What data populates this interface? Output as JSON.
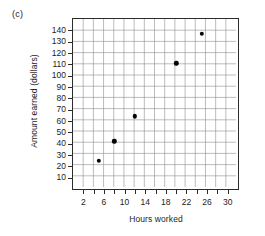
{
  "figure": {
    "part_label": "(c)"
  },
  "chart_data": {
    "type": "scatter",
    "title": "",
    "xlabel": "Hours worked",
    "ylabel": "Amount earned (dollars)",
    "xlim": [
      0,
      32
    ],
    "ylim": [
      0,
      150
    ],
    "grid": true,
    "legend": "none",
    "x_tick_step": 2,
    "y_tick_step": 10,
    "x_ticks": [
      2,
      4,
      6,
      8,
      10,
      12,
      14,
      16,
      18,
      20,
      22,
      24,
      26,
      28,
      30
    ],
    "x_tick_labels": [
      "2",
      "",
      "6",
      "",
      "10",
      "",
      "14",
      "",
      "18",
      "",
      "22",
      "",
      "26",
      "",
      "30"
    ],
    "y_ticks": [
      10,
      20,
      30,
      40,
      50,
      60,
      70,
      80,
      90,
      100,
      110,
      120,
      130,
      140
    ],
    "y_tick_labels": [
      "10",
      "20",
      "30",
      "40",
      "50",
      "60",
      "70",
      "80",
      "90",
      "100",
      "110",
      "120",
      "130",
      "140"
    ],
    "points": [
      {
        "x": 5,
        "y": 25
      },
      {
        "x": 8,
        "y": 42
      },
      {
        "x": 12,
        "y": 64
      },
      {
        "x": 20,
        "y": 111
      },
      {
        "x": 25,
        "y": 137
      }
    ],
    "marker": "filled-circle",
    "marker_color": "#050505"
  }
}
